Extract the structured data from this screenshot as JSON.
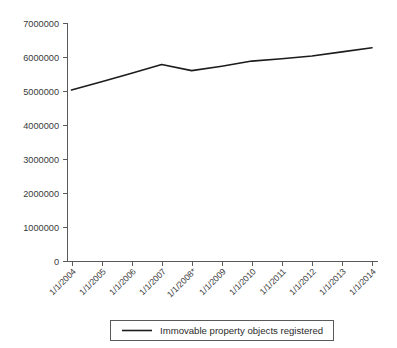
{
  "chart_data": {
    "type": "line",
    "title": "",
    "subtitle": "",
    "xlabel": "",
    "ylabel": "",
    "grid": false,
    "legend_position": "bottom",
    "categories": [
      "1/1/2004",
      "1/1/2005",
      "1/1/2006",
      "1/1/2007",
      "1/1/2008*",
      "1/1/2009",
      "1/1/2010",
      "1/1/2011",
      "1/1/2012",
      "1/1/2013",
      "1/1/2014"
    ],
    "series": [
      {
        "name": "Immovable property objects registered",
        "color": "#1c1c1c",
        "values": [
          5030000,
          5270000,
          5520000,
          5780000,
          5600000,
          5730000,
          5880000,
          5950000,
          6030000,
          6150000,
          6270000
        ]
      }
    ],
    "ylim": [
      0,
      7000000
    ],
    "ytick_values": [
      0,
      1000000,
      2000000,
      3000000,
      4000000,
      5000000,
      6000000,
      7000000
    ],
    "ytick_labels": [
      "0",
      "1000000",
      "2000000",
      "3000000",
      "4000000",
      "5000000",
      "6000000",
      "7000000"
    ],
    "xtick_rotation_degrees": -45,
    "footnote_marker": "*"
  },
  "legend": {
    "entries": [
      {
        "label": "Immovable property objects registered",
        "color": "#1c1c1c"
      }
    ]
  },
  "colors": {
    "series": "#1c1c1c",
    "axis": "#5a5a5a",
    "text": "#3a3a3a",
    "background": "#ffffff"
  }
}
